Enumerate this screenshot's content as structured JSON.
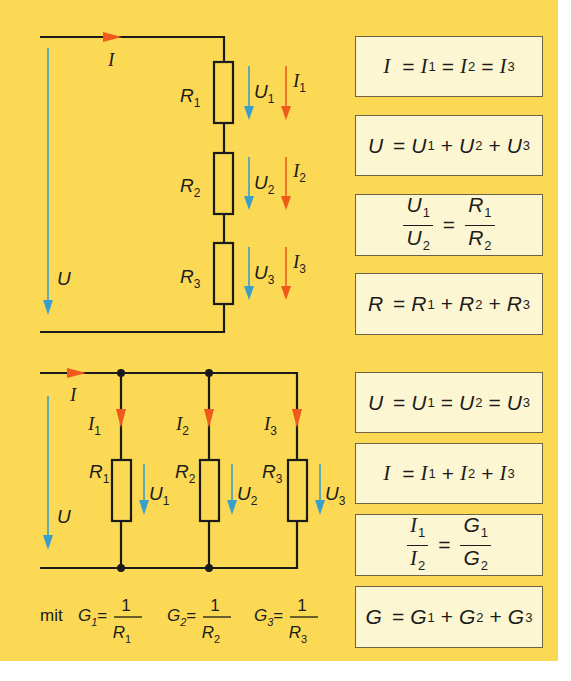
{
  "colors": {
    "background": "#fbd955",
    "wire": "#1a1a1a",
    "voltage_arrow": "#3a9fc8",
    "current_arrow": "#ef5a1c",
    "formula_box_fill": "#fdf6d3",
    "formula_box_border": "#6b6248"
  },
  "series_circuit": {
    "total_current_label": "I",
    "total_voltage_label": "U",
    "resistors": [
      {
        "label": "R",
        "sub": "1",
        "voltage": "U",
        "voltage_sub": "1",
        "current": "I",
        "current_sub": "1"
      },
      {
        "label": "R",
        "sub": "2",
        "voltage": "U",
        "voltage_sub": "2",
        "current": "I",
        "current_sub": "2"
      },
      {
        "label": "R",
        "sub": "3",
        "voltage": "U",
        "voltage_sub": "3",
        "current": "I",
        "current_sub": "3"
      }
    ],
    "formulas": [
      "I = I1 = I2 = I3",
      "U = U1 + U2 + U3",
      "U1/U2 = R1/R2",
      "R = R1 + R2 + R3"
    ]
  },
  "parallel_circuit": {
    "total_current_label": "I",
    "total_voltage_label": "U",
    "resistors": [
      {
        "label": "R",
        "sub": "1",
        "voltage": "U",
        "voltage_sub": "1",
        "current": "I",
        "current_sub": "1"
      },
      {
        "label": "R",
        "sub": "2",
        "voltage": "U",
        "voltage_sub": "2",
        "current": "I",
        "current_sub": "2"
      },
      {
        "label": "R",
        "sub": "3",
        "voltage": "U",
        "voltage_sub": "3",
        "current": "I",
        "current_sub": "3"
      }
    ],
    "conductance_note": {
      "prefix": "mit",
      "items": [
        {
          "g": "G",
          "g_sub": "1",
          "num": "1",
          "den": "R",
          "den_sub": "1"
        },
        {
          "g": "G",
          "g_sub": "2",
          "num": "1",
          "den": "R",
          "den_sub": "2"
        },
        {
          "g": "G",
          "g_sub": "3",
          "num": "1",
          "den": "R",
          "den_sub": "3"
        }
      ]
    },
    "formulas": [
      "U = U1 = U2 = U3",
      "I = I1 + I2 + I3",
      "I1/I2 = G1/G2",
      "G = G1 + G2 + G3"
    ]
  },
  "symbols": {
    "eq": "=",
    "plus": "+",
    "one": "1",
    "s1": "1",
    "s2": "2",
    "s3": "3",
    "I": "I",
    "U": "U",
    "R": "R",
    "G": "G"
  }
}
